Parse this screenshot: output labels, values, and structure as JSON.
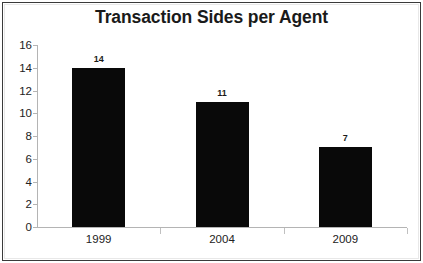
{
  "chart_data": {
    "type": "bar",
    "title": "Transaction Sides per Agent",
    "xlabel": "",
    "ylabel": "",
    "categories": [
      "1999",
      "2004",
      "2009"
    ],
    "values": [
      14,
      11,
      7
    ],
    "data_labels": [
      "14",
      "11",
      "7"
    ],
    "ylim": [
      0,
      16
    ],
    "ytick_step": 2,
    "yticks": [
      "16",
      "14",
      "12",
      "10",
      "8",
      "6",
      "4",
      "2",
      "0"
    ],
    "ytick_values": [
      16,
      14,
      12,
      10,
      8,
      6,
      4,
      2,
      0
    ],
    "grid": false,
    "legend": false,
    "legend_position": "none",
    "series": [
      {
        "name": "Transaction Sides per Agent",
        "values": [
          14,
          11,
          7
        ]
      }
    ],
    "colors": {
      "bar": "#090909",
      "axis": "#b4b4b4",
      "text": "#222222",
      "title": "#1a1a1a",
      "background": "#ffffff",
      "border": "#3a3a3a"
    }
  }
}
